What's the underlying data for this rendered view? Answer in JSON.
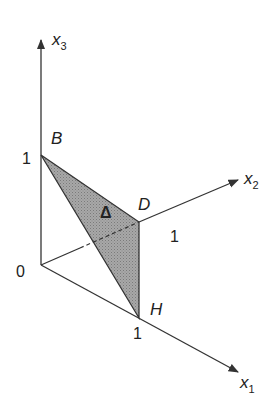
{
  "diagram": {
    "axes": {
      "x1": {
        "label": "x",
        "subscript": "1"
      },
      "x2": {
        "label": "x",
        "subscript": "2"
      },
      "x3": {
        "label": "x",
        "subscript": "3"
      }
    },
    "origin_label": "0",
    "points": {
      "B": {
        "label": "B",
        "tick": "1"
      },
      "D": {
        "label": "D",
        "tick": "1"
      },
      "H": {
        "label": "H",
        "tick": "1"
      }
    },
    "region_label": "Δ",
    "colors": {
      "line": "#333333",
      "fill": "#9a9a9a"
    }
  }
}
